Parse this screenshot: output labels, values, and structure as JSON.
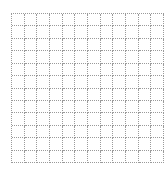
{
  "canvas": {
    "rows": 12,
    "columns": 12,
    "line_color": "#9a9a9a",
    "line_style": "dotted",
    "cell_fill": "#ffffff"
  }
}
